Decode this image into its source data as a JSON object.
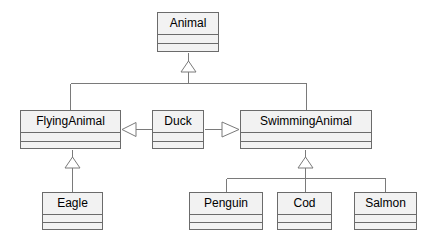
{
  "diagram": {
    "kind": "uml-class-diagram",
    "background_color": "#ffffff",
    "class_fill_color": "#f2f2f2",
    "class_border_color": "#6b6b6b",
    "line_color": "#7a7a7a",
    "text_color": "#000000",
    "classes": [
      {
        "id": "animal",
        "name": "Animal",
        "x": 157,
        "y": 12,
        "width": 62,
        "height": 40,
        "name_h": 22,
        "attr_h": 9
      },
      {
        "id": "flyinganimal",
        "name": "FlyingAnimal",
        "x": 20,
        "y": 110,
        "width": 101,
        "height": 39,
        "name_h": 22,
        "attr_h": 9
      },
      {
        "id": "duck",
        "name": "Duck",
        "x": 152,
        "y": 110,
        "width": 52,
        "height": 39,
        "name_h": 22,
        "attr_h": 9
      },
      {
        "id": "swimminganimal",
        "name": "SwimmingAnimal",
        "x": 240,
        "y": 110,
        "width": 132,
        "height": 39,
        "name_h": 22,
        "attr_h": 9
      },
      {
        "id": "eagle",
        "name": "Eagle",
        "x": 42,
        "y": 192,
        "width": 61,
        "height": 38,
        "name_h": 22,
        "attr_h": 8
      },
      {
        "id": "penguin",
        "name": "Penguin",
        "x": 189,
        "y": 192,
        "width": 74,
        "height": 38,
        "name_h": 22,
        "attr_h": 8
      },
      {
        "id": "cod",
        "name": "Cod",
        "x": 277,
        "y": 192,
        "width": 55,
        "height": 38,
        "name_h": 22,
        "attr_h": 8
      },
      {
        "id": "salmon",
        "name": "Salmon",
        "x": 354,
        "y": 192,
        "width": 63,
        "height": 38,
        "name_h": 22,
        "attr_h": 8
      }
    ],
    "relations": [
      {
        "id": "flyinganimal-to-animal",
        "type": "generalization",
        "source": "flyinganimal",
        "target": "animal",
        "arrow": "hollow-triangle",
        "direction": "up"
      },
      {
        "id": "swimminganimal-to-animal",
        "type": "generalization",
        "source": "swimminganimal",
        "target": "animal",
        "arrow": "hollow-triangle",
        "direction": "up"
      },
      {
        "id": "duck-to-flyinganimal",
        "type": "generalization",
        "source": "duck",
        "target": "flyinganimal",
        "arrow": "hollow-triangle",
        "direction": "left"
      },
      {
        "id": "duck-to-swimminganimal",
        "type": "generalization",
        "source": "duck",
        "target": "swimminganimal",
        "arrow": "hollow-triangle",
        "direction": "right"
      },
      {
        "id": "eagle-to-flyinganimal",
        "type": "generalization",
        "source": "eagle",
        "target": "flyinganimal",
        "arrow": "hollow-triangle",
        "direction": "up"
      },
      {
        "id": "penguin-to-swimminganimal",
        "type": "generalization",
        "source": "penguin",
        "target": "swimminganimal",
        "arrow": "hollow-triangle",
        "direction": "up"
      },
      {
        "id": "cod-to-swimminganimal",
        "type": "generalization",
        "source": "cod",
        "target": "swimminganimal",
        "arrow": "hollow-triangle",
        "direction": "up"
      },
      {
        "id": "salmon-to-swimminganimal",
        "type": "generalization",
        "source": "salmon",
        "target": "swimminganimal",
        "arrow": "hollow-triangle",
        "direction": "up"
      }
    ]
  }
}
